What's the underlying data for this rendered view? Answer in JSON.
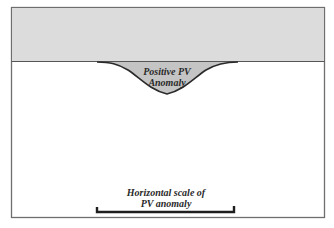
{
  "diagram": {
    "colors": {
      "stratosphere_fill": "#dcdcdc",
      "anomaly_fill": "#c4c4c4",
      "frame": "#6e6e6e",
      "outline": "#2a2a2a",
      "background": "#ffffff"
    },
    "anomaly_label": {
      "line1": "Positive PV",
      "line2": "Anomaly"
    },
    "scale_label": {
      "line1": "Horizontal scale of",
      "line2": "PV anomaly"
    }
  }
}
